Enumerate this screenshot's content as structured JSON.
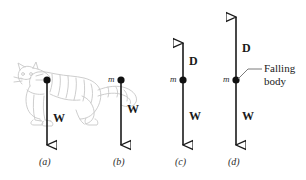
{
  "figure": {
    "background_color": "#ffffff",
    "line_color": "#1a1a1a",
    "cat_color": "#c9c9c9"
  },
  "panels": [
    {
      "id": "a",
      "caption": "(a)",
      "subject": "cat-drawing",
      "mass_label": "",
      "forces": [
        {
          "symbol": "W",
          "name": "weight",
          "direction": "down"
        }
      ]
    },
    {
      "id": "b",
      "caption": "(b)",
      "subject": "point-mass",
      "mass_label": "m",
      "forces": [
        {
          "symbol": "W",
          "name": "weight",
          "direction": "down"
        }
      ]
    },
    {
      "id": "c",
      "caption": "(c)",
      "subject": "point-mass",
      "mass_label": "m",
      "forces": [
        {
          "symbol": "D",
          "name": "drag",
          "direction": "up"
        },
        {
          "symbol": "W",
          "name": "weight",
          "direction": "down"
        }
      ]
    },
    {
      "id": "d",
      "caption": "(d)",
      "subject": "point-mass",
      "mass_label": "m",
      "callout": "Falling\nbody",
      "callout_line1": "Falling",
      "callout_line2": "body",
      "forces": [
        {
          "symbol": "D",
          "name": "drag",
          "direction": "up"
        },
        {
          "symbol": "W",
          "name": "weight",
          "direction": "down"
        }
      ]
    }
  ],
  "labels": {
    "panel_a_caption": "(a)",
    "panel_b_caption": "(b)",
    "panel_c_caption": "(c)",
    "panel_d_caption": "(d)",
    "panel_a_weight": "W",
    "panel_b_weight": "W",
    "panel_b_mass": "m",
    "panel_c_drag": "D",
    "panel_c_weight": "W",
    "panel_c_mass": "m",
    "panel_d_drag": "D",
    "panel_d_weight": "W",
    "panel_d_mass": "m",
    "falling_body_line1": "Falling",
    "falling_body_line2": "body"
  }
}
